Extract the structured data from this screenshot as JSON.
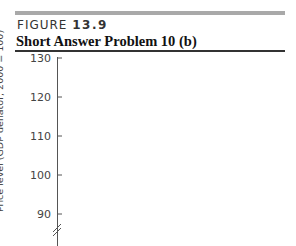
{
  "figure": {
    "label_prefix": "FIGURE ",
    "label_number": "13.9",
    "title": "Short Answer Problem 10 (b)"
  },
  "chart_data": {
    "type": "line",
    "title": "Short Answer Problem 10 (b)",
    "xlabel": "",
    "ylabel": "Price level (GDP deflator, 2000 = 100)",
    "y_ticks": [
      130,
      120,
      110,
      100,
      90
    ],
    "ylim": [
      85,
      130
    ],
    "axis_break": true,
    "grid": false,
    "series": [],
    "legend": null
  },
  "colors": {
    "top_bar": "#a9a9a9",
    "axis": "#555555",
    "text": "#222222"
  }
}
